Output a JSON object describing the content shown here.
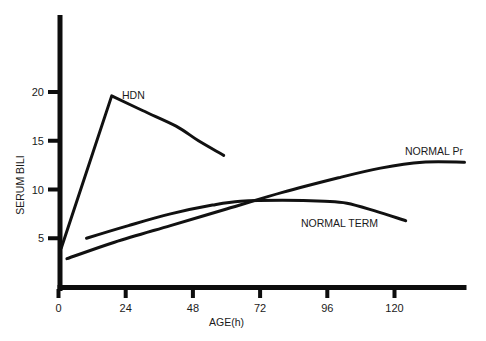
{
  "chart_data": {
    "type": "line",
    "title": "",
    "xlabel": "AGE(h)",
    "ylabel": "SERUM BILI",
    "xlim": [
      0,
      145
    ],
    "ylim": [
      0,
      28
    ],
    "x_ticks": [
      0,
      24,
      48,
      72,
      96,
      120
    ],
    "y_ticks": [
      5,
      10,
      15,
      20
    ],
    "grid": false,
    "legend": "inline labels",
    "series": [
      {
        "name": "HDN",
        "x": [
          1,
          19,
          30,
          42,
          50,
          59
        ],
        "y": [
          4.0,
          19.6,
          18.1,
          16.5,
          15.0,
          13.5
        ],
        "label_pos": [
          22,
          19.8
        ]
      },
      {
        "name": "NORMAL Pr",
        "x": [
          3,
          20,
          40,
          60,
          80,
          100,
          115,
          130,
          145
        ],
        "y": [
          2.9,
          4.6,
          6.3,
          8.0,
          9.7,
          11.2,
          12.2,
          12.8,
          12.8
        ],
        "label_pos": [
          126,
          13.5
        ]
      },
      {
        "name": "NORMAL TERM",
        "x": [
          10,
          25,
          40,
          55,
          65,
          80,
          95,
          103,
          113,
          124
        ],
        "y": [
          5.0,
          6.3,
          7.5,
          8.4,
          8.8,
          8.9,
          8.8,
          8.6,
          7.8,
          6.8
        ],
        "label_pos": [
          86,
          5.6
        ]
      }
    ]
  },
  "axes": {
    "x_title": "AGE(h)",
    "y_title": "SERUM BILI",
    "x_tick_labels": [
      "0",
      "24",
      "48",
      "72",
      "96",
      "120"
    ],
    "y_tick_labels": [
      "5",
      "10",
      "15",
      "20"
    ]
  },
  "labels": {
    "hdn": "HDN",
    "normal_pr": "NORMAL Pr",
    "normal_term": "NORMAL TERM"
  }
}
